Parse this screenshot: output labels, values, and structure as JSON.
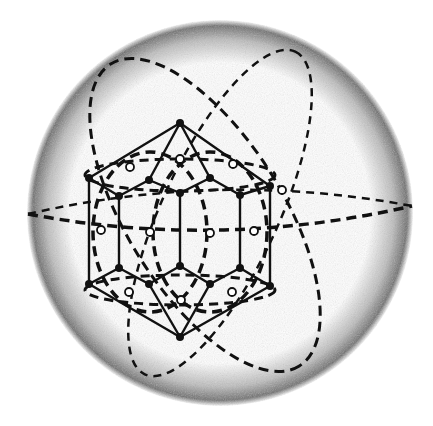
{
  "figure": {
    "description": "Polyhedron (truncated-style solid with hexagonal outline) inscribed in a sphere, with dashed great-circle ellipses",
    "colors": {
      "background": "#ffffff",
      "ink": "#111111",
      "sphere_shade": "#777777"
    },
    "sphere": {
      "cx": 220,
      "cy": 213,
      "r": 186
    },
    "great_circles": [
      {
        "id": "equator-upper",
        "cx": 220,
        "cy": 203,
        "rx": 192,
        "ry": 42,
        "rot": 0
      },
      {
        "id": "equator-lower",
        "cx": 220,
        "cy": 220,
        "rx": 192,
        "ry": 18,
        "rot": 0
      },
      {
        "id": "tilt-left",
        "cx": 190,
        "cy": 210,
        "rx": 175,
        "ry": 70,
        "rot": 70
      },
      {
        "id": "tilt-right",
        "cx": 220,
        "cy": 215,
        "rx": 178,
        "ry": 60,
        "rot": -62
      },
      {
        "id": "inner-left",
        "cx": 150,
        "cy": 232,
        "rx": 60,
        "ry": 135,
        "rot": 0
      },
      {
        "id": "inner-right",
        "cx": 210,
        "cy": 232,
        "rx": 60,
        "ry": 135,
        "rot": 0
      }
    ],
    "solid_vertices_count": 24,
    "open_vertices_count": 14
  }
}
